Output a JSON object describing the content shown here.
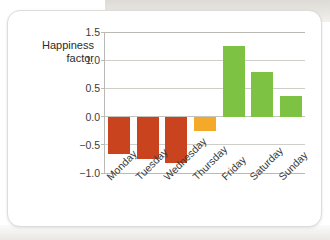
{
  "chart_data": {
    "type": "bar",
    "title": "",
    "subtitle": "",
    "xlabel": "",
    "ylabel": "Happiness factor",
    "ylabel_lines": [
      "Happiness",
      "factor"
    ],
    "categories": [
      "Monday",
      "Tuesday",
      "Wednesday",
      "Thursday",
      "Friday",
      "Saturday",
      "Sunday"
    ],
    "values": [
      -0.67,
      -0.76,
      -0.82,
      -0.26,
      1.26,
      0.79,
      0.36
    ],
    "bar_colors": [
      "#c8431e",
      "#c8431e",
      "#c8431e",
      "#f5a929",
      "#7dc242",
      "#7dc242",
      "#7dc242"
    ],
    "ylim": [
      -1.0,
      1.5
    ],
    "yticks": [
      1.5,
      1.0,
      0.5,
      0.0,
      -0.5,
      -1.0
    ],
    "ytick_labels": [
      "1.5",
      "1.0",
      "0.5",
      "0.0",
      "−0.5",
      "−1.0"
    ],
    "grid": true,
    "legend": false,
    "legend_position": "none",
    "xtick_rotation": -45
  },
  "colors": {
    "negative_bar": "#c8431e",
    "neutral_bar": "#f5a929",
    "positive_bar": "#7dc242",
    "gridline": "#cfcfca",
    "axis": "#b9b9b5",
    "text": "#3a3a3a",
    "card_border": "#dcdcd8",
    "card_background": "#ffffff"
  }
}
